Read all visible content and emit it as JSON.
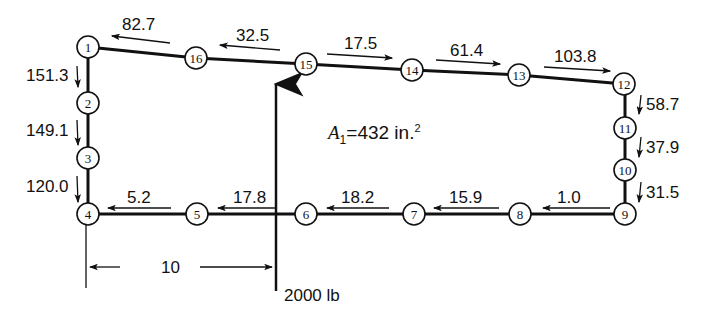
{
  "diagram": {
    "area_label": {
      "symbol": "A",
      "subscript": "1",
      "text": "=432 in.",
      "superscript": "2"
    },
    "load_label": "2000 lb",
    "dimension_label": "10",
    "nodes": [
      {
        "id": "1",
        "x": 88,
        "y": 47
      },
      {
        "id": "2",
        "x": 88,
        "y": 103
      },
      {
        "id": "3",
        "x": 88,
        "y": 158
      },
      {
        "id": "4",
        "x": 88,
        "y": 214
      },
      {
        "id": "5",
        "x": 197,
        "y": 214
      },
      {
        "id": "6",
        "x": 306,
        "y": 214
      },
      {
        "id": "7",
        "x": 414,
        "y": 214
      },
      {
        "id": "8",
        "x": 520,
        "y": 214
      },
      {
        "id": "9",
        "x": 625,
        "y": 214
      },
      {
        "id": "10",
        "x": 625,
        "y": 170
      },
      {
        "id": "11",
        "x": 625,
        "y": 128
      },
      {
        "id": "12",
        "x": 624,
        "y": 84
      },
      {
        "id": "13",
        "x": 519,
        "y": 75
      },
      {
        "id": "14",
        "x": 412,
        "y": 70
      },
      {
        "id": "15",
        "x": 306,
        "y": 64
      },
      {
        "id": "16",
        "x": 196,
        "y": 58
      }
    ],
    "shear_flows": [
      {
        "between": "1-16",
        "value": "82.7",
        "direction": "left"
      },
      {
        "between": "16-15",
        "value": "32.5",
        "direction": "left"
      },
      {
        "between": "15-14",
        "value": "17.5",
        "direction": "right"
      },
      {
        "between": "14-13",
        "value": "61.4",
        "direction": "right"
      },
      {
        "between": "13-12",
        "value": "103.8",
        "direction": "right"
      },
      {
        "between": "12-11",
        "value": "58.7",
        "direction": "down"
      },
      {
        "between": "11-10",
        "value": "37.9",
        "direction": "down"
      },
      {
        "between": "10-9",
        "value": "31.5",
        "direction": "down"
      },
      {
        "between": "9-8",
        "value": "1.0",
        "direction": "left"
      },
      {
        "between": "8-7",
        "value": "15.9",
        "direction": "left"
      },
      {
        "between": "7-6",
        "value": "18.2",
        "direction": "left"
      },
      {
        "between": "6-5",
        "value": "17.8",
        "direction": "left"
      },
      {
        "between": "5-4",
        "value": "5.2",
        "direction": "left"
      },
      {
        "between": "1-2",
        "value": "151.3",
        "direction": "down"
      },
      {
        "between": "2-3",
        "value": "149.1",
        "direction": "down"
      },
      {
        "between": "3-4",
        "value": "120.0",
        "direction": "down"
      }
    ]
  }
}
